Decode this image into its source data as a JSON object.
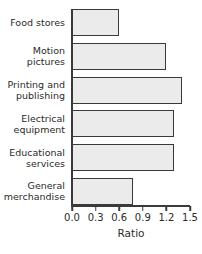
{
  "chart_data": {
    "type": "bar",
    "orientation": "horizontal",
    "title": "",
    "xlabel": "Ratio",
    "ylabel": "",
    "xlim": [
      0.0,
      1.5
    ],
    "xticks": [
      "0.0",
      "0.3",
      "0.6",
      "0.9",
      "1.2",
      "1.5"
    ],
    "xtick_values": [
      0.0,
      0.3,
      0.6,
      0.9,
      1.2,
      1.5
    ],
    "grid": false,
    "legend": false,
    "categories": [
      "Food stores",
      "Motion\npictures",
      "Printing and\npublishing",
      "Electrical\nequipment",
      "Educational\nservices",
      "General\nmerchandise"
    ],
    "values": [
      0.6,
      1.2,
      1.4,
      1.3,
      1.3,
      0.78
    ],
    "bar_fill_color": "#ebebeb",
    "bar_edge_color": "#3a3a3a",
    "axis_color": "#3a3a3a",
    "background_color": "#ffffff"
  }
}
